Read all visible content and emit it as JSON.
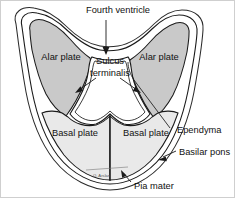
{
  "figure": {
    "title": "Fourth ventricle",
    "signature": "O. Arslan",
    "colors": {
      "alar_plate_fill": "#c9c9c9",
      "basal_plate_fill": "#e9e9e9",
      "ventricle_fill": "#ffffff",
      "outline": "#1a1a1a",
      "pia_mater_line": "#2b2b2b",
      "frame": "#cfcfcf",
      "background": "#ffffff",
      "label_text": "#111111"
    }
  },
  "labels": {
    "fourth_ventricle": "Fourth ventricle",
    "sulcus_terminalis_line1": "Sulcus",
    "sulcus_terminalis_line2": "terminalis",
    "alar_plate_left": "Alar plate",
    "alar_plate_right": "Alar plate",
    "basal_plate_left": "Basal plate",
    "basal_plate_right": "Basal plate",
    "ependyma": "Ependyma",
    "basilar_pons": "Basilar pons",
    "pia_mater": "Pia mater",
    "signature": "O. Arslan"
  }
}
